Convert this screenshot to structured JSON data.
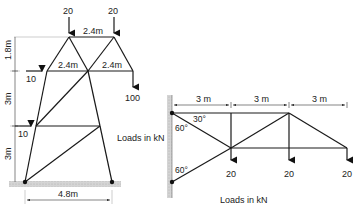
{
  "figure": {
    "left_truss": {
      "name": "tower-truss",
      "dimensions": {
        "top_span": "2.4m",
        "mid_left_span": "2.4m",
        "mid_right_span": "2.4m",
        "height_top": "1.8m",
        "height_mid": "3m",
        "height_bottom": "3m",
        "base_width": "4.8m"
      },
      "loads": {
        "top_left": "20",
        "top_right": "20",
        "horizontal_upper": "10",
        "horizontal_lower": "10",
        "tip": "100"
      },
      "note": "Loads in kN"
    },
    "right_truss": {
      "name": "cantilever-truss",
      "dimensions": {
        "bay_1": "3 m",
        "bay_2": "3 m",
        "bay_3": "3 m"
      },
      "angles": {
        "top_angle_a": "30°",
        "top_angle_b": "60°",
        "bottom_angle": "60°"
      },
      "loads": {
        "load_1": "20",
        "load_2": "20",
        "load_3": "20"
      },
      "note": "Loads in kN"
    },
    "colors": {
      "member": "#1a1a1a",
      "ground_hatch": "#c8c8c8",
      "text": "#222222"
    }
  }
}
